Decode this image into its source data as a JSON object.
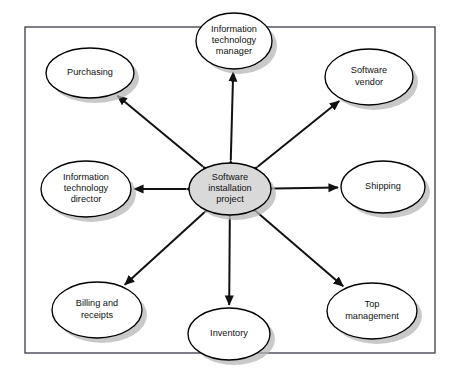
{
  "diagram": {
    "frame": {
      "name": "project-boundary",
      "x": 25,
      "y": 27,
      "width": 410,
      "height": 326
    },
    "colors": {
      "center_fill": "#d9d9d9",
      "node_fill": "#ffffff",
      "node_stroke": "#000000",
      "shadow": "#b4b4b4",
      "frame_stroke": "#3a3a4a",
      "arrow": "#111111"
    },
    "center": {
      "id": "software-installation-project",
      "label": "Software installation project",
      "lines": [
        "Software",
        "installation",
        "project"
      ],
      "cx": 230,
      "cy": 189,
      "rx": 41,
      "ry": 26
    },
    "nodes": [
      {
        "id": "information-technology-manager",
        "label": "Information technology manager",
        "lines": [
          "Information",
          "technology",
          "manager"
        ],
        "cx": 234,
        "cy": 41,
        "rx": 38,
        "ry": 28
      },
      {
        "id": "software-vendor",
        "label": "Software vendor",
        "lines": [
          "Software",
          "vendor"
        ],
        "cx": 369,
        "cy": 77,
        "rx": 44,
        "ry": 28
      },
      {
        "id": "shipping",
        "label": "Shipping",
        "lines": [
          "Shipping"
        ],
        "cx": 383,
        "cy": 187,
        "rx": 42,
        "ry": 26
      },
      {
        "id": "top-management",
        "label": "Top management",
        "lines": [
          "Top",
          "management"
        ],
        "cx": 372,
        "cy": 311,
        "rx": 45,
        "ry": 28
      },
      {
        "id": "inventory",
        "label": "Inventory",
        "lines": [
          "Inventory"
        ],
        "cx": 229,
        "cy": 334,
        "rx": 41,
        "ry": 26
      },
      {
        "id": "billing-and-receipts",
        "label": "Billing and receipts",
        "lines": [
          "Billing and",
          "receipts"
        ],
        "cx": 97,
        "cy": 310,
        "rx": 45,
        "ry": 28
      },
      {
        "id": "information-technology-director",
        "label": "Information technology director",
        "lines": [
          "Information",
          "technology",
          "director"
        ],
        "cx": 86,
        "cy": 189,
        "rx": 45,
        "ry": 28
      },
      {
        "id": "purchasing",
        "label": "Purchasing",
        "lines": [
          "Purchasing"
        ],
        "cx": 90,
        "cy": 73,
        "rx": 44,
        "ry": 25
      }
    ],
    "connections": [
      {
        "id": "link-it-manager",
        "from": "software-installation-project",
        "to": "information-technology-manager",
        "style": "double-arrow"
      },
      {
        "id": "link-software-vendor",
        "from": "software-installation-project",
        "to": "software-vendor",
        "style": "double-arrow"
      },
      {
        "id": "link-shipping",
        "from": "software-installation-project",
        "to": "shipping",
        "style": "double-arrow"
      },
      {
        "id": "link-top-management",
        "from": "software-installation-project",
        "to": "top-management",
        "style": "double-arrow"
      },
      {
        "id": "link-inventory",
        "from": "software-installation-project",
        "to": "inventory",
        "style": "double-arrow"
      },
      {
        "id": "link-billing",
        "from": "software-installation-project",
        "to": "billing-and-receipts",
        "style": "double-arrow"
      },
      {
        "id": "link-it-director",
        "from": "software-installation-project",
        "to": "information-technology-director",
        "style": "double-arrow"
      },
      {
        "id": "link-purchasing",
        "from": "software-installation-project",
        "to": "purchasing",
        "style": "double-arrow"
      }
    ]
  }
}
